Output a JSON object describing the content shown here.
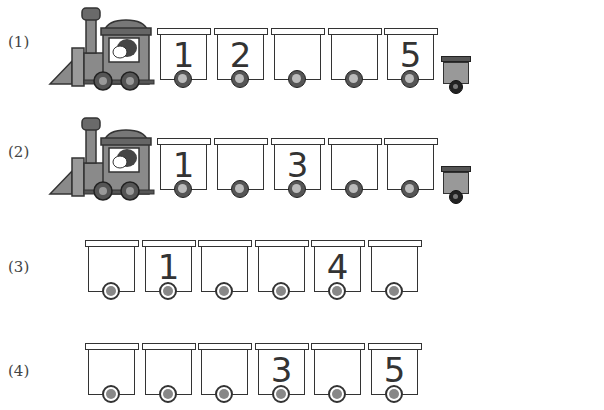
{
  "problems": [
    {
      "label": "(1)",
      "has_engine": true,
      "cars": [
        "1",
        "2",
        "",
        "",
        "5"
      ],
      "has_caboose": true
    },
    {
      "label": "(2)",
      "has_engine": true,
      "cars": [
        "1",
        "",
        "3",
        "",
        ""
      ],
      "has_caboose": true
    },
    {
      "label": "(3)",
      "has_engine": false,
      "cars": [
        "",
        "1",
        "",
        "",
        "4",
        ""
      ],
      "has_caboose": false
    },
    {
      "label": "(4)",
      "has_engine": false,
      "cars": [
        "",
        "",
        "",
        "3",
        "",
        "5"
      ],
      "has_caboose": false
    }
  ],
  "colors": {
    "outline": "#333333",
    "engine_body": "#8a8a8a",
    "engine_dark": "#555555",
    "caboose": "#999999"
  }
}
